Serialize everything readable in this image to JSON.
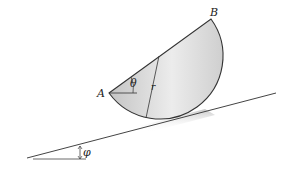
{
  "figure": {
    "labels": {
      "point_a": "A",
      "point_b": "B",
      "angle_theta": "θ",
      "radius": "r",
      "angle_phi": "φ"
    },
    "colors": {
      "body_fill_light": "#e8e8e8",
      "body_fill_dark": "#c8c8c8",
      "outline": "#333333",
      "incline": "#444444"
    }
  }
}
